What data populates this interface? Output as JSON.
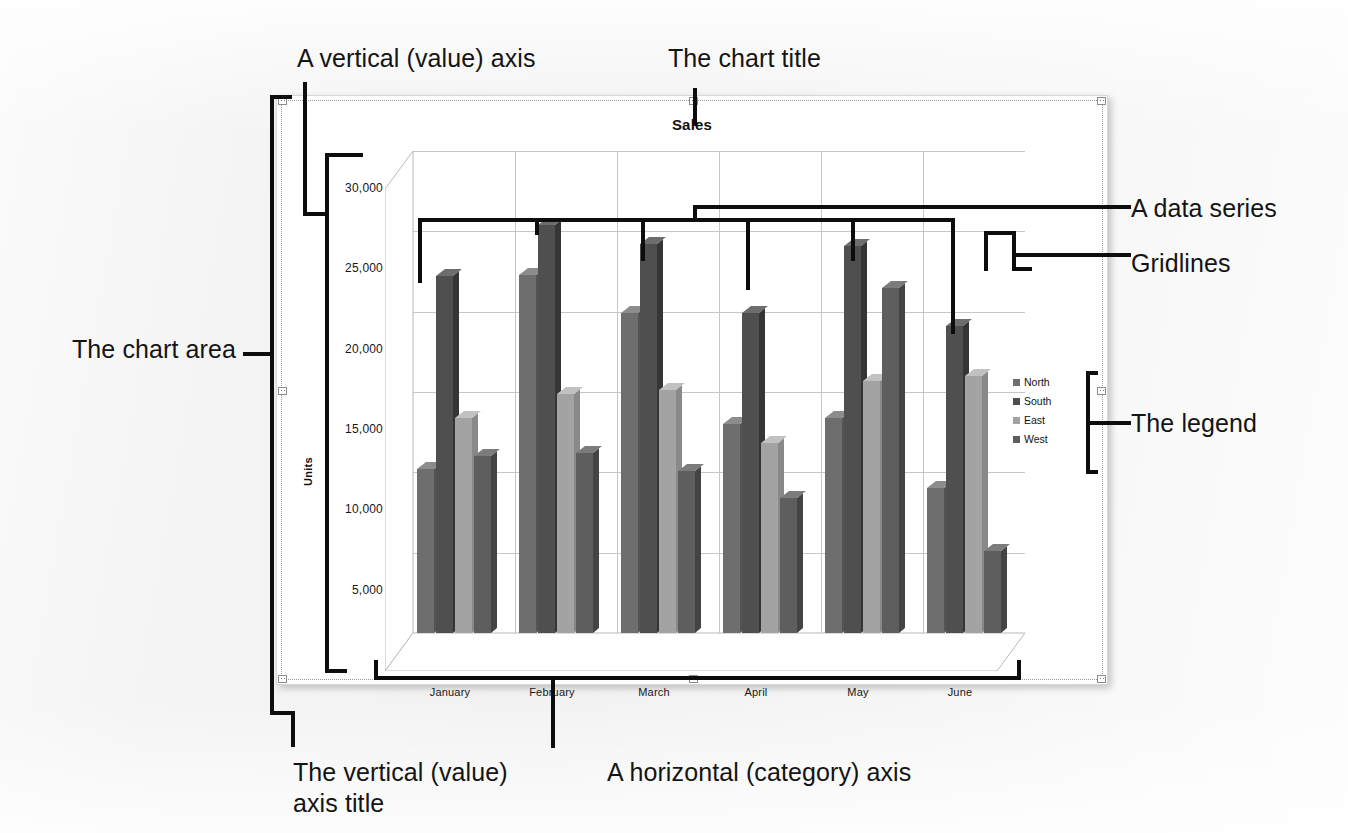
{
  "chart_data": {
    "type": "bar",
    "title": "Sales",
    "xlabel": "",
    "ylabel": "Units",
    "categories": [
      "January",
      "February",
      "March",
      "April",
      "May",
      "June"
    ],
    "series": [
      {
        "name": "North",
        "color": "#6e6e6e",
        "values": [
          10200,
          22300,
          19900,
          13000,
          13400,
          9000
        ]
      },
      {
        "name": "South",
        "color": "#4f4f4f",
        "values": [
          22200,
          25400,
          24200,
          19900,
          24100,
          19100
        ]
      },
      {
        "name": "East",
        "color": "#a3a3a3",
        "values": [
          13400,
          14900,
          15100,
          11800,
          15700,
          16000
        ]
      },
      {
        "name": "West",
        "color": "#5e5e5e",
        "values": [
          11000,
          11200,
          10100,
          8400,
          21500,
          5100
        ]
      }
    ],
    "yticks": [
      "5,000",
      "10,000",
      "15,000",
      "20,000",
      "25,000",
      "30,000"
    ],
    "ytick_values": [
      5000,
      10000,
      15000,
      20000,
      25000,
      30000
    ],
    "ylim": [
      0,
      30000
    ],
    "grid": true,
    "legend_position": "right",
    "three_d": true
  },
  "callouts": {
    "vertical_axis": "A vertical (value) axis",
    "chart_title": "The chart title",
    "data_series": "A data series",
    "gridlines": "Gridlines",
    "legend": "The legend",
    "chart_area": "The chart area",
    "vertical_axis_title": "The vertical (value)\naxis title",
    "horizontal_axis": "A horizontal (category) axis"
  },
  "chart": {
    "title": "Sales",
    "axis_title_y": "Units"
  }
}
